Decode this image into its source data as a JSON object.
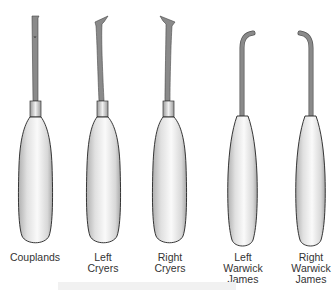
{
  "figure": {
    "instruments": [
      {
        "name": "Couplands",
        "label_lines": [
          "Couplands",
          "",
          ""
        ],
        "tip": "straight"
      },
      {
        "name": "Left Cryers",
        "label_lines": [
          "Left",
          "Cryers",
          ""
        ],
        "tip": "triangular-left"
      },
      {
        "name": "Right Cryers",
        "label_lines": [
          "Right",
          "Cryers",
          ""
        ],
        "tip": "triangular-right"
      },
      {
        "name": "Left Warwick James",
        "label_lines": [
          "Left",
          "Warwick",
          "James"
        ],
        "tip": "hook-right"
      },
      {
        "name": "Right Warwick James",
        "label_lines": [
          "Right",
          "Warwick",
          "James"
        ],
        "tip": "hook-left"
      }
    ]
  },
  "colors": {
    "shaft": "#8a8a8a",
    "outline": "#222222",
    "handle_light": "#f5f5f5",
    "handle_shade": "#bdbdbd",
    "text": "#333333"
  }
}
